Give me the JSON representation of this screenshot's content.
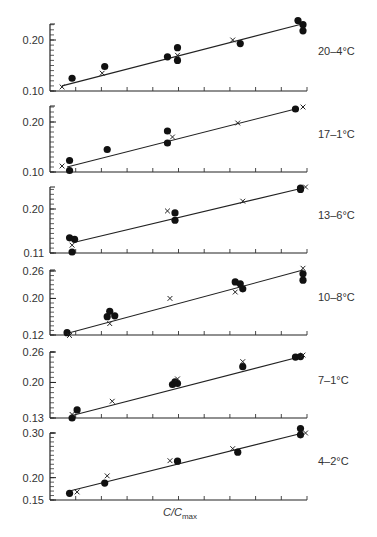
{
  "chart_data": {
    "type": "scatter",
    "layout": "6 vertically stacked panels sharing x-axis",
    "xlabel": "C/C_max",
    "xlabel_main": "C/C",
    "xlabel_sub": "max",
    "x_ticks_count": 10,
    "x_range": [
      0,
      1
    ],
    "marker_legend": {
      "dot": "filled circle",
      "cross": "x"
    },
    "panels": [
      {
        "label": "20–4°C",
        "y_ticks": [
          "0.20",
          "0.10"
        ],
        "ylim": [
          0.1,
          0.23
        ],
        "tick_values": [
          0.2,
          0.1
        ],
        "fit_line": [
          [
            0.04,
            0.11
          ],
          [
            1.0,
            0.232
          ]
        ],
        "dots": [
          [
            0.08,
            0.125
          ],
          [
            0.21,
            0.148
          ],
          [
            0.46,
            0.167
          ],
          [
            0.5,
            0.185
          ],
          [
            0.5,
            0.16
          ],
          [
            0.75,
            0.193
          ],
          [
            0.98,
            0.238
          ],
          [
            1.0,
            0.23
          ],
          [
            1.0,
            0.218
          ]
        ],
        "crosses": [
          [
            0.04,
            0.108
          ],
          [
            0.2,
            0.135
          ],
          [
            0.5,
            0.17
          ],
          [
            0.72,
            0.2
          ]
        ]
      },
      {
        "label": "17–1°C",
        "y_ticks": [
          "0.20",
          "0.10"
        ],
        "ylim": [
          0.1,
          0.23
        ],
        "tick_values": [
          0.2,
          0.1
        ],
        "fit_line": [
          [
            0.06,
            0.11
          ],
          [
            0.97,
            0.226
          ]
        ],
        "dots": [
          [
            0.07,
            0.123
          ],
          [
            0.07,
            0.103
          ],
          [
            0.22,
            0.145
          ],
          [
            0.46,
            0.182
          ],
          [
            0.46,
            0.158
          ],
          [
            0.97,
            0.226
          ]
        ],
        "crosses": [
          [
            0.04,
            0.112
          ],
          [
            0.48,
            0.17
          ],
          [
            0.74,
            0.198
          ],
          [
            1.0,
            0.23
          ]
        ]
      },
      {
        "label": "13–6°C",
        "y_ticks": [
          "0.20",
          "0.11"
        ],
        "ylim": [
          0.11,
          0.25
        ],
        "tick_values": [
          0.2,
          0.11
        ],
        "fit_line": [
          [
            0.09,
            0.132
          ],
          [
            1.0,
            0.243
          ]
        ],
        "dots": [
          [
            0.07,
            0.141
          ],
          [
            0.09,
            0.138
          ],
          [
            0.08,
            0.112
          ],
          [
            0.49,
            0.192
          ],
          [
            0.49,
            0.177
          ],
          [
            0.99,
            0.243
          ],
          [
            0.99,
            0.24
          ]
        ],
        "crosses": [
          [
            0.08,
            0.126
          ],
          [
            0.46,
            0.196
          ],
          [
            0.76,
            0.216
          ],
          [
            1.01,
            0.245
          ]
        ]
      },
      {
        "label": "10–8°C",
        "y_ticks": [
          "0.26",
          "0.20",
          "0.12"
        ],
        "ylim": [
          0.12,
          0.27
        ],
        "tick_values": [
          0.26,
          0.2,
          0.12
        ],
        "fit_line": [
          [
            0.07,
            0.125
          ],
          [
            1.0,
            0.262
          ]
        ],
        "dots": [
          [
            0.06,
            0.125
          ],
          [
            0.22,
            0.16
          ],
          [
            0.23,
            0.172
          ],
          [
            0.25,
            0.162
          ],
          [
            0.73,
            0.236
          ],
          [
            0.75,
            0.232
          ],
          [
            0.76,
            0.221
          ],
          [
            1.0,
            0.254
          ],
          [
            1.0,
            0.24
          ]
        ],
        "crosses": [
          [
            0.07,
            0.119
          ],
          [
            0.23,
            0.145
          ],
          [
            0.47,
            0.2
          ],
          [
            0.73,
            0.214
          ],
          [
            1.0,
            0.266
          ]
        ]
      },
      {
        "label": "7–1°C",
        "y_ticks": [
          "0.26",
          "0.20",
          "0.13"
        ],
        "ylim": [
          0.13,
          0.26
        ],
        "tick_values": [
          0.26,
          0.2,
          0.13
        ],
        "fit_line": [
          [
            0.08,
            0.135
          ],
          [
            1.0,
            0.252
          ]
        ],
        "dots": [
          [
            0.08,
            0.13
          ],
          [
            0.1,
            0.146
          ],
          [
            0.48,
            0.196
          ],
          [
            0.49,
            0.201
          ],
          [
            0.5,
            0.198
          ],
          [
            0.76,
            0.231
          ],
          [
            0.97,
            0.25
          ],
          [
            0.99,
            0.251
          ]
        ],
        "crosses": [
          [
            0.08,
            0.137
          ],
          [
            0.24,
            0.163
          ],
          [
            0.5,
            0.207
          ],
          [
            0.76,
            0.241
          ],
          [
            1.0,
            0.254
          ]
        ]
      },
      {
        "label": "4–2°C",
        "y_ticks": [
          "0.30",
          "0.20",
          "0.15"
        ],
        "ylim": [
          0.15,
          0.3
        ],
        "tick_values": [
          0.3,
          0.2,
          0.15
        ],
        "fit_line": [
          [
            0.07,
            0.17
          ],
          [
            1.0,
            0.3
          ]
        ],
        "dots": [
          [
            0.07,
            0.165
          ],
          [
            0.21,
            0.188
          ],
          [
            0.5,
            0.237
          ],
          [
            0.74,
            0.257
          ],
          [
            0.99,
            0.31
          ],
          [
            0.99,
            0.296
          ]
        ],
        "crosses": [
          [
            0.1,
            0.168
          ],
          [
            0.22,
            0.204
          ],
          [
            0.47,
            0.238
          ],
          [
            0.72,
            0.265
          ],
          [
            1.01,
            0.3
          ]
        ]
      }
    ]
  },
  "panels_display": [
    {
      "label": "20–4°C",
      "ticks": [
        "0.20",
        "0.10"
      ]
    },
    {
      "label": "17–1°C",
      "ticks": [
        "0.20",
        "0.10"
      ]
    },
    {
      "label": "13–6°C",
      "ticks": [
        "0.20",
        "0.11"
      ]
    },
    {
      "label": "10–8°C",
      "ticks": [
        "0.26",
        "0.20",
        "0.12"
      ]
    },
    {
      "label": "7–1°C",
      "ticks": [
        "0.26",
        "0.20",
        "0.13"
      ]
    },
    {
      "label": "4–2°C",
      "ticks": [
        "0.30",
        "0.20",
        "0.15"
      ]
    }
  ],
  "xaxis": {
    "main": "C/C",
    "sub": "max"
  }
}
